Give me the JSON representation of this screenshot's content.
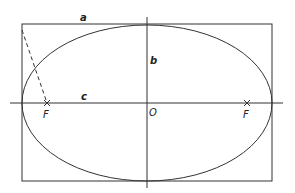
{
  "diagram": {
    "colors": {
      "stroke": "#333333",
      "background": "#ffffff"
    },
    "labels": {
      "a": "a",
      "b": "b",
      "c": "c",
      "origin": "O",
      "focus_left": "F",
      "focus_right": "F"
    },
    "geometry": {
      "center": [
        147,
        103
      ],
      "semi_major_a": 125,
      "semi_minor_b": 78,
      "focal_distance_c": 100,
      "bounding_rect": {
        "x": 22,
        "y": 24,
        "width": 250,
        "height": 157
      },
      "foci": [
        [
          47,
          103
        ],
        [
          247,
          103
        ]
      ]
    }
  }
}
